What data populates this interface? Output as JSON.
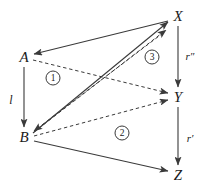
{
  "figure": {
    "kind": "commutative-diagram",
    "width": 204,
    "height": 192,
    "background": "#ffffff",
    "stroke_color": "#3a3a3a",
    "text_color": "#1a1a1a"
  },
  "nodes": [
    {
      "id": "A",
      "label": "A",
      "x": 24,
      "y": 57
    },
    {
      "id": "B",
      "label": "B",
      "x": 24,
      "y": 137
    },
    {
      "id": "X",
      "label": "X",
      "x": 178,
      "y": 16
    },
    {
      "id": "Y",
      "label": "Y",
      "x": 178,
      "y": 97
    },
    {
      "id": "Z",
      "label": "Z",
      "x": 178,
      "y": 175
    }
  ],
  "edge_labels": [
    {
      "id": "l",
      "label": "l",
      "x": 11,
      "y": 100
    },
    {
      "id": "rpp",
      "label": "r″",
      "x": 190,
      "y": 56
    },
    {
      "id": "rp",
      "label": "r′",
      "x": 190,
      "y": 138
    }
  ],
  "region_labels": [
    {
      "id": "one",
      "label": "1",
      "x": 53,
      "y": 78
    },
    {
      "id": "two",
      "label": "2",
      "x": 122,
      "y": 133
    },
    {
      "id": "three",
      "label": "3",
      "x": 152,
      "y": 57
    }
  ],
  "edges": [
    {
      "id": "A-to-B",
      "from": "A",
      "to": "B",
      "style": "solid",
      "label": "l",
      "x1": 24,
      "y1": 67,
      "x2": 24,
      "y2": 127
    },
    {
      "id": "X-to-Y",
      "from": "X",
      "to": "Y",
      "style": "solid",
      "label": "r″",
      "x1": 178,
      "y1": 26,
      "x2": 178,
      "y2": 87
    },
    {
      "id": "Y-to-Z",
      "from": "Y",
      "to": "Z",
      "style": "solid",
      "label": "r′",
      "x1": 178,
      "y1": 107,
      "x2": 178,
      "y2": 165
    },
    {
      "id": "B-to-X",
      "from": "B",
      "to": "X",
      "style": "solid",
      "label": "",
      "x1": 33,
      "y1": 133,
      "x2": 168,
      "y2": 22
    },
    {
      "id": "X-to-A",
      "from": "X",
      "to": "A",
      "style": "solid",
      "label": "",
      "x1": 168,
      "y1": 21,
      "x2": 33,
      "y2": 55
    },
    {
      "id": "B-to-Z",
      "from": "B",
      "to": "Z",
      "style": "solid",
      "label": "",
      "x1": 34,
      "y1": 141,
      "x2": 168,
      "y2": 171
    },
    {
      "id": "A-to-Y",
      "from": "A",
      "to": "Y",
      "style": "dashed",
      "label": "",
      "x1": 33,
      "y1": 60,
      "x2": 168,
      "y2": 93
    },
    {
      "id": "B-to-X-dashed",
      "from": "B",
      "to": "X",
      "style": "dashed",
      "label": "",
      "x1": 34,
      "y1": 132,
      "x2": 167,
      "y2": 29
    },
    {
      "id": "B-to-Y-dashed",
      "from": "B",
      "to": "Y",
      "style": "dashed",
      "label": "",
      "x1": 34,
      "y1": 136,
      "x2": 168,
      "y2": 100
    },
    {
      "id": "X-to-B-dashed",
      "from": "X",
      "to": "B",
      "style": "dashed",
      "label": "",
      "x1": 163,
      "y1": 32,
      "x2": 33,
      "y2": 131
    }
  ]
}
